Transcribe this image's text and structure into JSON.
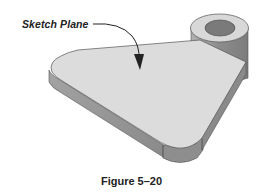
{
  "figure": {
    "callout_label": "Sketch Plane",
    "caption": "Figure 5–20",
    "colors": {
      "top_face": "#dcdcdc",
      "side_face": "#9a9a9a",
      "side_face_dark": "#858585",
      "boss_top": "#d6d6d6",
      "boss_hole": "#7a7a7a",
      "boss_side": "#8e8e8e",
      "outline": "#555555",
      "arrow": "#222222"
    }
  }
}
